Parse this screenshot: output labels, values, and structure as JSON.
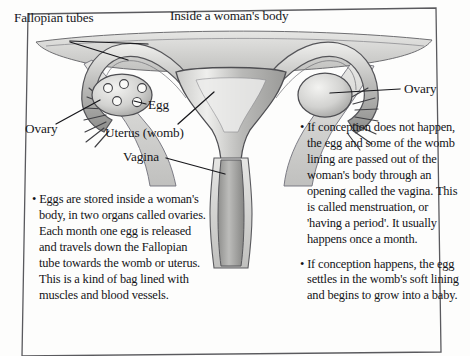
{
  "page": {
    "title": "Inside a woman's body",
    "border_color": "#5a5a5e",
    "background": "#fdfdfc",
    "ink_color": "#16161a"
  },
  "diagram": {
    "name": "female-reproductive-system-diagram",
    "colors": {
      "outline": "#4a4a4f",
      "tissue_light": "#d8d8d6",
      "tissue_mid": "#b6b6b4",
      "tissue_dark": "#8e8e8c",
      "canal_dark": "#9a9a98",
      "white": "#f7f7f5"
    },
    "parts": [
      "fallopian-tube-left",
      "fallopian-tube-right",
      "fimbriae-left",
      "fimbriae-right",
      "ovary-left",
      "ovary-right",
      "uterus-body",
      "cervix",
      "vaginal-canal",
      "broad-ligament"
    ],
    "egg_count_left_ovary": 5
  },
  "labels": {
    "fallopian": "Fallopian tubes",
    "egg": "Egg",
    "ovary_left": "Ovary",
    "ovary_right": "Ovary",
    "uterus": "Uterus (womb)",
    "vagina": "Vagina"
  },
  "text_left": {
    "paragraphs": [
      "• Eggs are stored inside a woman's body, in two organs called ovaries. Each month one egg is released and travels down the Fallopian tube towards the womb or uterus. This is a kind of bag lined with muscles and blood vessels."
    ]
  },
  "text_right": {
    "paragraphs": [
      "• If conception does not happen, the egg and some of the womb lining are passed out of the woman's body through an opening called the vagina. This is called menstruation, or 'having a period'. It usually happens once a month.",
      "• If conception happens, the egg settles in the womb's soft lining and begins to grow into a baby."
    ]
  }
}
